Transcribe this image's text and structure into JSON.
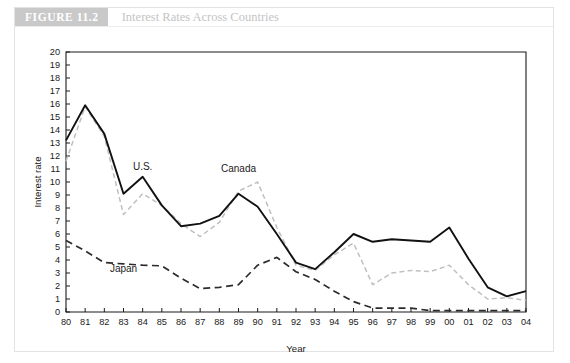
{
  "figure": {
    "tag": "FIGURE 11.2",
    "caption": "Interest Rates Across Countries",
    "tag_bg": "#c9c9c9",
    "caption_color": "#c4c4c4"
  },
  "chart_data": {
    "type": "line",
    "title": "Interest Rates Across Countries",
    "xlabel": "Year",
    "ylabel": "Interest rate",
    "xlim": [
      1980,
      2004
    ],
    "ylim": [
      0,
      20
    ],
    "ytick_step": 1,
    "grid": false,
    "legend_position": "inline-annotations",
    "x": [
      1980,
      1981,
      1982,
      1983,
      1984,
      1985,
      1986,
      1987,
      1988,
      1989,
      1990,
      1991,
      1992,
      1993,
      1994,
      1995,
      1996,
      1997,
      1998,
      1999,
      2000,
      2001,
      2002,
      2003,
      2004
    ],
    "tick_labels": [
      "80",
      "81",
      "82",
      "83",
      "84",
      "85",
      "86",
      "87",
      "88",
      "89",
      "90",
      "91",
      "92",
      "93",
      "94",
      "95",
      "96",
      "97",
      "98",
      "99",
      "00",
      "01",
      "02",
      "03",
      "04"
    ],
    "series": [
      {
        "name": "Canada",
        "style": "solid",
        "color": "#111111",
        "values": [
          13.2,
          15.9,
          13.7,
          9.1,
          10.4,
          8.2,
          6.6,
          6.8,
          7.4,
          9.1,
          8.1,
          6.0,
          3.8,
          3.3,
          4.6,
          6.0,
          5.4,
          5.6,
          5.5,
          5.4,
          6.5,
          4.1,
          1.9,
          1.2,
          1.6
        ]
      },
      {
        "name": "U.S.",
        "style": "dashed",
        "color": "#c0c0c0",
        "values": [
          11.6,
          15.8,
          13.5,
          7.5,
          9.1,
          8.2,
          6.8,
          5.8,
          6.9,
          9.3,
          10.0,
          6.5,
          3.6,
          3.2,
          4.4,
          5.3,
          2.1,
          3.0,
          3.2,
          3.1,
          3.6,
          2.1,
          1.0,
          1.1,
          0.9
        ]
      },
      {
        "name": "Japan",
        "style": "dashed",
        "color": "#2b2b2b",
        "values": [
          5.5,
          4.7,
          3.8,
          3.7,
          3.6,
          3.55,
          2.6,
          1.8,
          1.9,
          2.1,
          3.6,
          4.2,
          3.1,
          2.5,
          1.6,
          0.8,
          0.3,
          0.3,
          0.3,
          0.1,
          0.1,
          0.1,
          0.1,
          0.1,
          0.1
        ]
      }
    ],
    "annotations": [
      {
        "text": "U.S.",
        "x": 1984,
        "y": 10.9
      },
      {
        "text": "Canada",
        "x": 1989,
        "y": 10.8
      },
      {
        "text": "Japan",
        "x": 1983,
        "y": 3.05
      }
    ]
  }
}
